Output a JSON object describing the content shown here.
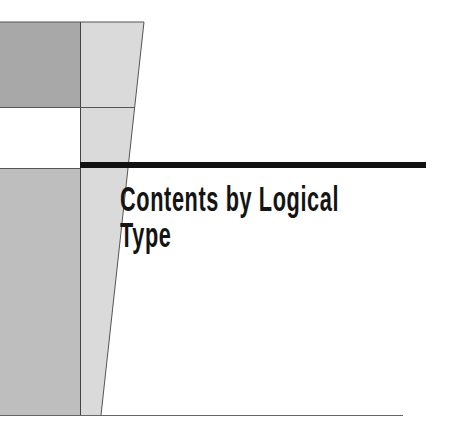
{
  "page": {
    "title_lines": [
      "Contents by Logical",
      "Type"
    ]
  },
  "colors": {
    "dark_gray_block": "#a6a6a6",
    "light_gray_panel": "#d9d9d9",
    "mid_gray_block": "#bdbdbd",
    "rule_black": "#111111",
    "outline": "#555555"
  }
}
